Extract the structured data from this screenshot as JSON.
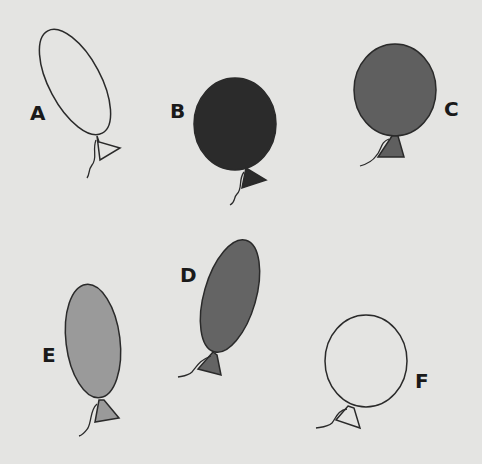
{
  "balloons": [
    {
      "label": "A",
      "fill": "#e4e4e2",
      "shape": "tall-oval",
      "tilt": "left"
    },
    {
      "label": "B",
      "fill": "#2b2b2b",
      "shape": "round",
      "tilt": "none"
    },
    {
      "label": "C",
      "fill": "#5f5f5f",
      "shape": "round",
      "tilt": "none"
    },
    {
      "label": "D",
      "fill": "#646464",
      "shape": "tall-oval",
      "tilt": "right"
    },
    {
      "label": "E",
      "fill": "#9a9a9a",
      "shape": "tall-oval",
      "tilt": "slight-left"
    },
    {
      "label": "F",
      "fill": "#e4e4e2",
      "shape": "round",
      "tilt": "none"
    }
  ],
  "colors": {
    "background": "#e4e4e2",
    "outline": "#2a2a2a"
  }
}
